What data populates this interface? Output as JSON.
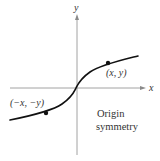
{
  "figure": {
    "title": "Origin symmetry",
    "axes": {
      "x_label": "x",
      "y_label": "y",
      "axis_color": "#8a8a8a"
    },
    "curve": {
      "color": "#111111",
      "description": "odd function, cube-root-like shape passing through origin"
    },
    "points": [
      {
        "label": "(x, y)",
        "color": "#111111"
      },
      {
        "label": "(−x, −y)",
        "color": "#111111"
      }
    ],
    "caption": {
      "line1": "Origin",
      "line2": "symmetry"
    }
  }
}
